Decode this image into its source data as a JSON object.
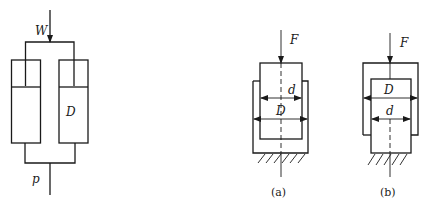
{
  "diagram": {
    "type": "hydraulic-cylinders",
    "colors": {
      "stroke": "#1a1a1a",
      "background": "#ffffff"
    },
    "left_figure": {
      "load_label": "W",
      "cylinder_diameter_label": "D",
      "pressure_label": "p"
    },
    "figure_a": {
      "force_label": "F",
      "inner_diameter_label": "d",
      "outer_diameter_label": "D",
      "caption": "(a)"
    },
    "figure_b": {
      "force_label": "F",
      "outer_diameter_label": "D",
      "inner_diameter_label": "d",
      "caption": "(b)"
    }
  }
}
